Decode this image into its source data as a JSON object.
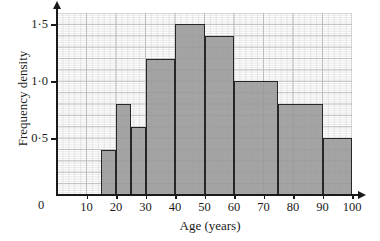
{
  "chart_data": {
    "type": "bar",
    "title": "",
    "subtitle": "",
    "xlabel": "Age (years)",
    "ylabel": "Frequency density",
    "xlim": [
      0,
      100
    ],
    "ylim": [
      0,
      1.6
    ],
    "grid": true,
    "legend": null,
    "legend_position": "none",
    "x_major_step": 10,
    "x_minor_step": 2,
    "y_major_step": 0.1,
    "y_minor_step": 0.02,
    "bar_fill_color": "#969696",
    "bar_edge_color": "#262626",
    "axis_color": "#1a1a1a",
    "grid_major_color": "#b9b9b9",
    "grid_minor_color": "#dedede",
    "x_tick_labels": [
      "10",
      "20",
      "30",
      "40",
      "50",
      "60",
      "70",
      "80",
      "90",
      "100"
    ],
    "x_tick_values": [
      10,
      20,
      30,
      40,
      50,
      60,
      70,
      80,
      90,
      100
    ],
    "y_tick_labels": [
      "0·5",
      "1·0",
      "1·5"
    ],
    "y_tick_values": [
      0.5,
      1.0,
      1.5
    ],
    "origin_label": "0",
    "bars": [
      {
        "label": "15-20",
        "x0": 15,
        "x1": 20,
        "value": 0.4
      },
      {
        "label": "20-25",
        "x0": 20,
        "x1": 25,
        "value": 0.8
      },
      {
        "label": "25-30",
        "x0": 25,
        "x1": 30,
        "value": 0.6
      },
      {
        "label": "30-40",
        "x0": 30,
        "x1": 40,
        "value": 1.2
      },
      {
        "label": "40-50",
        "x0": 40,
        "x1": 50,
        "value": 1.5
      },
      {
        "label": "50-60",
        "x0": 50,
        "x1": 60,
        "value": 1.4
      },
      {
        "label": "60-75",
        "x0": 60,
        "x1": 75,
        "value": 1.0
      },
      {
        "label": "75-90",
        "x0": 75,
        "x1": 90,
        "value": 0.8
      },
      {
        "label": "90-100",
        "x0": 90,
        "x1": 100,
        "value": 0.5
      }
    ]
  }
}
